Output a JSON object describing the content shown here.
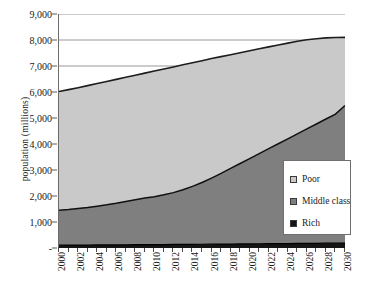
{
  "chart_data": {
    "type": "area",
    "stacked": true,
    "title": "",
    "xlabel": "",
    "ylabel": "population (millions)",
    "x": [
      2000,
      2001,
      2002,
      2003,
      2004,
      2005,
      2006,
      2007,
      2008,
      2009,
      2010,
      2011,
      2012,
      2013,
      2014,
      2015,
      2016,
      2017,
      2018,
      2019,
      2020,
      2021,
      2022,
      2023,
      2024,
      2025,
      2026,
      2027,
      2028,
      2029,
      2030
    ],
    "xtick_labels": [
      "2000",
      "2002",
      "2004",
      "2006",
      "2008",
      "2010",
      "2012",
      "2014",
      "2016",
      "2018",
      "2020",
      "2022",
      "2024",
      "2026",
      "2028",
      "2030"
    ],
    "ytick_labels": [
      "-",
      "1,000",
      "2,000",
      "3,000",
      "4,000",
      "5,000",
      "6,000",
      "7,000",
      "8,000",
      "9,000"
    ],
    "ylim": [
      0,
      9000
    ],
    "xlim": [
      2000,
      2030
    ],
    "grid": true,
    "legend_position": "inside-bottom-right",
    "series": [
      {
        "name": "Rich",
        "color": "#151515",
        "values": [
          110,
          112,
          114,
          116,
          118,
          120,
          122,
          124,
          126,
          128,
          130,
          133,
          136,
          139,
          142,
          145,
          148,
          151,
          154,
          157,
          160,
          163,
          166,
          169,
          172,
          175,
          178,
          181,
          184,
          187,
          190
        ]
      },
      {
        "name": "Middle class",
        "color": "#7f7f7f",
        "cumulative_top": [
          1450,
          1480,
          1520,
          1560,
          1610,
          1660,
          1720,
          1790,
          1860,
          1920,
          1975,
          2045,
          2130,
          2240,
          2370,
          2520,
          2690,
          2870,
          3060,
          3250,
          3440,
          3630,
          3820,
          4010,
          4200,
          4390,
          4580,
          4770,
          4960,
          5150,
          5480
        ]
      },
      {
        "name": "Poor",
        "color": "#c9c9c9",
        "cumulative_top": [
          6020,
          6090,
          6165,
          6245,
          6325,
          6405,
          6485,
          6565,
          6645,
          6725,
          6805,
          6885,
          6965,
          7045,
          7125,
          7205,
          7285,
          7360,
          7435,
          7510,
          7585,
          7660,
          7735,
          7810,
          7880,
          7950,
          8010,
          8050,
          8080,
          8095,
          8100
        ]
      }
    ],
    "legend_entries": [
      "Poor",
      "Middle class",
      "Rich"
    ]
  },
  "axes": {
    "y_title": "population (millions)"
  }
}
